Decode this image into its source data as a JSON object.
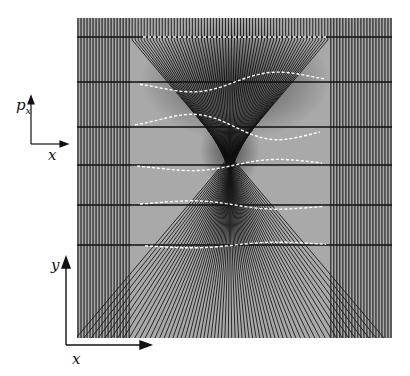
{
  "figure": {
    "panel": {
      "x": 77,
      "y": 18,
      "width": 315,
      "height": 320,
      "background": "#9a9a9a"
    },
    "focus": {
      "x": 230,
      "y": 172
    },
    "caustic_base": {
      "left": 135,
      "right": 296,
      "y": 338
    },
    "horizontal_lines_y": [
      37,
      82,
      127,
      165,
      205,
      245
    ],
    "dashed_curves": [
      {
        "y": 37,
        "x_start": 143,
        "x_end": 327,
        "bump": 0
      },
      {
        "y": 82,
        "x_start": 140,
        "x_end": 326,
        "bump": 14
      },
      {
        "y": 127,
        "x_start": 135,
        "x_end": 320,
        "bump": 18
      },
      {
        "y": 165,
        "x_start": 137,
        "x_end": 322,
        "bump": 8
      },
      {
        "y": 205,
        "x_start": 140,
        "x_end": 324,
        "bump": 6
      },
      {
        "y": 245,
        "x_start": 145,
        "x_end": 326,
        "bump": 4
      }
    ],
    "colors": {
      "ray": "#1a1a1a",
      "panel": "#a8a8a8",
      "dash": "#ffffff",
      "axis": "#111111"
    }
  },
  "axes_top": {
    "y_label": "p",
    "y_sub": "x",
    "x_label": "x"
  },
  "axes_bottom": {
    "y_label": "y",
    "x_label": "x"
  }
}
